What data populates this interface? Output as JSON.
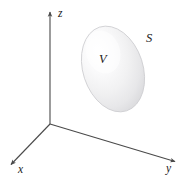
{
  "figure": {
    "kind": "3d-coordinate-axes-with-solid-region",
    "background_color": "#ffffff",
    "axis_color": "#4a4a4a",
    "label_color": "#1a1a1a",
    "surface_fill_light": "#fdfdfd",
    "surface_fill_mid": "#ececed",
    "surface_fill_dark": "#d8d8da",
    "surface_outline_color": "#c9c9cc",
    "axes": [
      {
        "name": "z",
        "label": "z",
        "label_x": 58,
        "label_y": 17,
        "from_x": 50,
        "from_y": 124,
        "to_x": 50,
        "to_y": 11
      },
      {
        "name": "y",
        "label": "y",
        "label_x": 166,
        "label_y": 172,
        "from_x": 50,
        "from_y": 124,
        "to_x": 177,
        "to_y": 162
      },
      {
        "name": "x",
        "label": "x",
        "label_x": 18,
        "label_y": 173,
        "from_x": 50,
        "from_y": 124,
        "to_x": 9,
        "to_y": 166
      }
    ],
    "region_labels": [
      {
        "name": "volume",
        "text": "V",
        "x": 99,
        "y": 63
      },
      {
        "name": "surface",
        "text": "S",
        "x": 146,
        "y": 42
      }
    ],
    "solid": {
      "name": "closed-surface-blob",
      "center_x": 113,
      "center_y": 69,
      "radius_x": 30,
      "radius_y": 44,
      "rotation_deg": -18
    }
  }
}
